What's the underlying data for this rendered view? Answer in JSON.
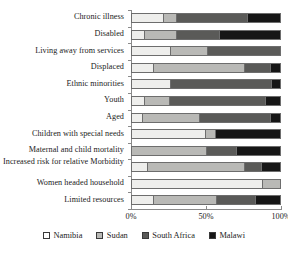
{
  "chart_data": {
    "type": "bar",
    "orientation": "horizontal",
    "stacked": true,
    "normalized": "100%",
    "title": "",
    "xlabel": "",
    "ylabel": "",
    "xlim": [
      0,
      100
    ],
    "xticks": [
      0,
      50,
      100
    ],
    "xtick_labels": [
      "0%",
      "50%",
      "100%"
    ],
    "grid": false,
    "legend_position": "bottom",
    "categories": [
      "Chronic illness",
      "Disabled",
      "Living away from services",
      "Displaced",
      "Ethnic minorities",
      "Youth",
      "Aged",
      "Children with special needs",
      "Maternal and child mortality",
      "Increased risk for relative Morbidity",
      "Women headed household",
      "Limited resources"
    ],
    "series": [
      {
        "name": "Namibia",
        "color": "#eeeeec",
        "values": [
          21,
          8,
          26,
          14,
          26,
          8,
          7,
          49,
          0,
          10,
          88,
          14
        ]
      },
      {
        "name": "Sudan",
        "color": "#b9b9b6",
        "values": [
          9,
          22,
          25,
          62,
          0,
          17,
          38,
          7,
          50,
          66,
          12,
          43
        ]
      },
      {
        "name": "South Africa",
        "color": "#5a5a58",
        "values": [
          48,
          29,
          49,
          17,
          68,
          65,
          48,
          0,
          20,
          11,
          0,
          26
        ]
      },
      {
        "name": "Malawi",
        "color": "#161616",
        "values": [
          22,
          41,
          0,
          7,
          6,
          10,
          7,
          44,
          30,
          13,
          0,
          17
        ]
      }
    ]
  },
  "legend": {
    "items": [
      {
        "label": "Namibia"
      },
      {
        "label": "Sudan"
      },
      {
        "label": "South Africa"
      },
      {
        "label": "Malawi"
      }
    ]
  }
}
